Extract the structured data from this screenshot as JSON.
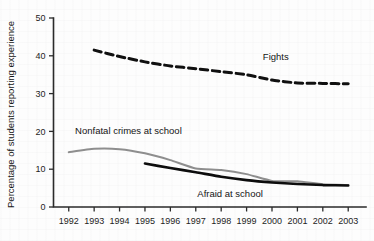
{
  "chart_data": {
    "type": "line",
    "title": "",
    "xlabel": "",
    "ylabel": "Percentage of students reporting experience",
    "x": [
      1992,
      1993,
      1994,
      1995,
      1996,
      1997,
      1998,
      1999,
      2000,
      2001,
      2002,
      2003
    ],
    "xtick_labels": [
      "1992",
      "1993",
      "1994",
      "1995",
      "1996",
      "1997",
      "1998",
      "1999",
      "2000",
      "2001",
      "2002",
      "2003"
    ],
    "ytick_labels": [
      "0",
      "10",
      "20",
      "30",
      "40",
      "50"
    ],
    "ytick_values": [
      0,
      10,
      20,
      30,
      40,
      50
    ],
    "xlim": [
      1991.4,
      2003.7
    ],
    "ylim": [
      0,
      50
    ],
    "grid": false,
    "legend_position": "inline-labels",
    "series": [
      {
        "name": "Fights",
        "label": "Fights",
        "style": "dashed",
        "color": "#101010",
        "width": 3.0,
        "x": [
          1993,
          1994,
          1995,
          1996,
          1997,
          1998,
          1999,
          2000,
          2001,
          2002,
          2003
        ],
        "values": [
          41.5,
          39.8,
          38.4,
          37.3,
          36.6,
          35.8,
          35.0,
          33.6,
          32.8,
          32.7,
          32.6
        ]
      },
      {
        "name": "Nonfatal crimes at school",
        "label": "Nonfatal crimes at school",
        "style": "solid",
        "color": "#8e8e8e",
        "width": 2.0,
        "x": [
          1992,
          1993,
          1994,
          1995,
          1996,
          1997,
          1998,
          1999,
          2000,
          2001,
          2002,
          2003
        ],
        "values": [
          14.5,
          15.4,
          15.3,
          14.2,
          12.4,
          10.2,
          9.8,
          8.7,
          6.9,
          6.8,
          6.0,
          5.8
        ]
      },
      {
        "name": "Afraid at school",
        "label": "Afraid at school",
        "style": "solid",
        "color": "#0d0d0d",
        "width": 2.6,
        "x": [
          1995,
          1996,
          1997,
          1998,
          1999,
          2000,
          2001,
          2002,
          2003
        ],
        "values": [
          11.5,
          10.3,
          9.2,
          8.0,
          7.1,
          6.5,
          6.1,
          5.8,
          5.7
        ]
      }
    ],
    "annotations": [
      {
        "text": "Fights",
        "x": 2000.15,
        "y": 39.0,
        "anchor": "middle"
      },
      {
        "text": "Nonfatal crimes at school",
        "x": 1994.35,
        "y": 19.4,
        "anchor": "middle"
      },
      {
        "text": "Afraid at school",
        "x": 1998.35,
        "y": 2.6,
        "anchor": "middle"
      }
    ]
  }
}
